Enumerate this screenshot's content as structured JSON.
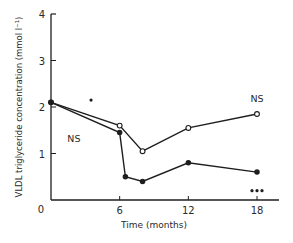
{
  "chart_data": {
    "type": "line",
    "title": "",
    "xlabel": "Time (months)",
    "ylabel": "VLDL triglyceride concentration (mmol l⁻¹)",
    "xlim": [
      0,
      20
    ],
    "ylim": [
      0,
      4
    ],
    "x_ticks": [
      "0",
      "6",
      "12",
      "18"
    ],
    "y_ticks": [
      "0",
      "1",
      "2",
      "3",
      "4"
    ],
    "grid": false,
    "series": [
      {
        "name": "open-circles",
        "marker": "open",
        "x": [
          0,
          6,
          8,
          12,
          18
        ],
        "values": [
          2.1,
          1.6,
          1.05,
          1.55,
          1.85
        ]
      },
      {
        "name": "filled-circles",
        "marker": "filled",
        "x": [
          0,
          6,
          6.5,
          8,
          12,
          18
        ],
        "values": [
          2.1,
          1.45,
          0.5,
          0.4,
          0.8,
          0.6
        ]
      }
    ],
    "annotations": [
      {
        "text": "NS",
        "x": 2,
        "y": 1.25
      },
      {
        "text": "NS",
        "x": 18,
        "y": 2.1
      },
      {
        "text": "*",
        "x": 3.5,
        "y": 2.15
      },
      {
        "text": "***",
        "x": 18,
        "y": 0.2
      }
    ]
  }
}
